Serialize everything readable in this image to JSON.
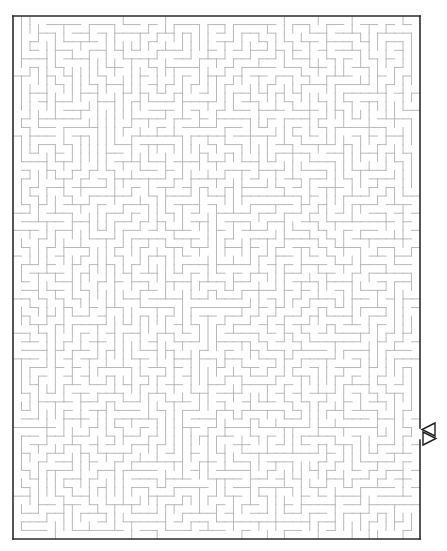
{
  "maze": {
    "title": "Maze puzzle",
    "canvas": {
      "width": 447,
      "height": 551
    },
    "bounds": {
      "left": 13,
      "top": 16,
      "right": 420,
      "bottom": 539
    },
    "grid": {
      "cols": 48,
      "rows": 61
    },
    "seed": 20240517,
    "colors": {
      "wall": "#b9b9b9",
      "border": "#2b2b2b",
      "background": "#ffffff",
      "arrow": "#1e1e1e"
    },
    "exit": {
      "side": "right",
      "row": 49,
      "y_top": 428,
      "y_bottom": 440
    },
    "arrows": [
      {
        "name": "arrow-in-icon",
        "direction": "left",
        "points": "435,423 422,429.5 435,436"
      },
      {
        "name": "arrow-out-icon",
        "direction": "right",
        "points": "423,432 436,438.5 423,445"
      }
    ]
  }
}
